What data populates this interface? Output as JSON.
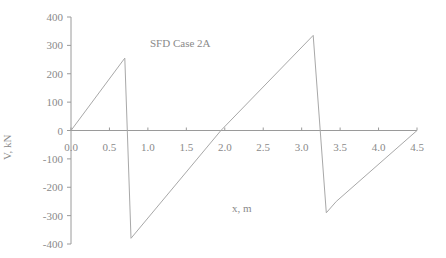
{
  "chart_data": {
    "type": "line",
    "title": "SFD Case 2A",
    "xlabel": "x, m",
    "ylabel": "V, kN",
    "xlim": [
      0,
      4.5
    ],
    "ylim": [
      -400,
      400
    ],
    "grid": false,
    "legend": null,
    "x_ticks": [
      0.0,
      0.5,
      1.0,
      1.5,
      2.0,
      2.5,
      3.0,
      3.5,
      4.0,
      4.5
    ],
    "x_tick_labels": [
      "0.0",
      "0.5",
      "1.0",
      "1.5",
      "2.0",
      "2.5",
      "3.0",
      "3.5",
      "4.0",
      "4.5"
    ],
    "y_ticks": [
      400,
      300,
      200,
      100,
      0,
      -100,
      -200,
      -300,
      -400
    ],
    "y_tick_labels": [
      "400",
      "300",
      "200",
      "100",
      "0",
      "-100",
      "-200",
      "-300",
      "-400"
    ],
    "series": [
      {
        "name": "Shear force V",
        "x": [
          0.0,
          0.7,
          0.78,
          1.95,
          3.15,
          3.32,
          3.45,
          4.5
        ],
        "y": [
          0,
          255,
          -380,
          0,
          335,
          -290,
          -250,
          0
        ]
      }
    ]
  },
  "plot": {
    "left": 71,
    "right": 417,
    "top": 17,
    "bottom": 244
  },
  "colors": {
    "axis": "#9a9a9a",
    "line": "#a8a8a8",
    "text": "#8a8a8a"
  }
}
